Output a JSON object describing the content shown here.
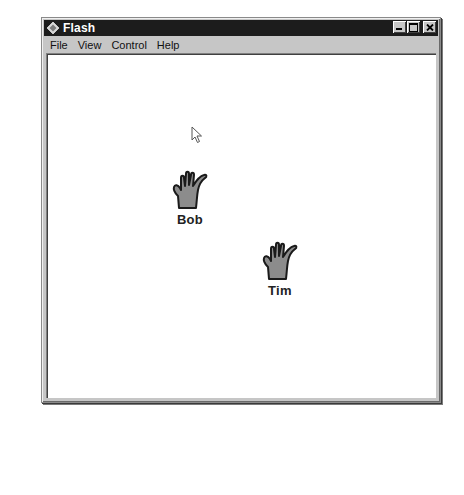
{
  "window": {
    "title": "Flash",
    "app_icon": "flash-diamond-icon",
    "controls": {
      "minimize": "minimize-icon",
      "maximize": "maximize-icon",
      "close": "close-icon"
    }
  },
  "menubar": {
    "items": [
      {
        "label": "File"
      },
      {
        "label": "View"
      },
      {
        "label": "Control"
      },
      {
        "label": "Help"
      }
    ]
  },
  "stage": {
    "background": "#ffffff",
    "sprites": [
      {
        "label": "Bob",
        "icon": "hand-icon",
        "fill": "#8c8c8c"
      },
      {
        "label": "Tim",
        "icon": "hand-icon",
        "fill": "#8c8c8c"
      }
    ],
    "cursor": "arrow-cursor-icon"
  },
  "colors": {
    "titlebar_bg": "#1c1c1c",
    "titlebar_text": "#ffffff",
    "chrome": "#c6c6c6"
  }
}
